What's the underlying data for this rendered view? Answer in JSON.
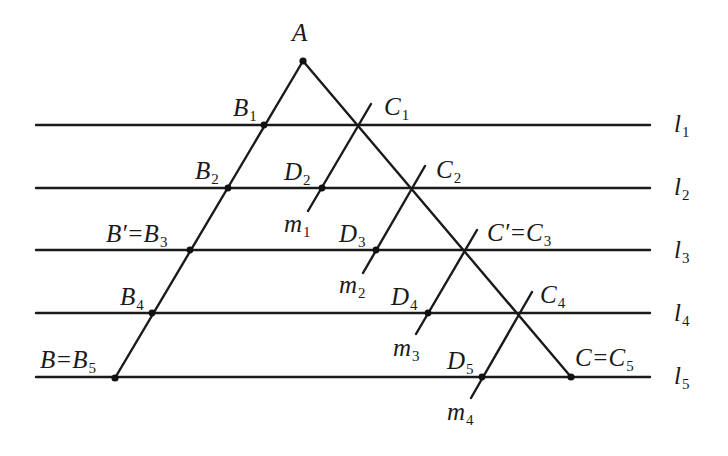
{
  "figure": {
    "points": {
      "A": {
        "label": "A",
        "sub": ""
      },
      "B1": {
        "label": "B",
        "sub": "1"
      },
      "B2": {
        "label": "B",
        "sub": "2"
      },
      "B3": {
        "label": "B′=B",
        "sub": "3"
      },
      "B4": {
        "label": "B",
        "sub": "4"
      },
      "B5": {
        "label": "B=B",
        "sub": "5"
      },
      "C1": {
        "label": "C",
        "sub": "1"
      },
      "C2": {
        "label": "C",
        "sub": "2"
      },
      "C3": {
        "label": "C′=C",
        "sub": "3"
      },
      "C4": {
        "label": "C",
        "sub": "4"
      },
      "C5": {
        "label": "C=C",
        "sub": "5"
      },
      "D2": {
        "label": "D",
        "sub": "2"
      },
      "D3": {
        "label": "D",
        "sub": "3"
      },
      "D4": {
        "label": "D",
        "sub": "4"
      },
      "D5": {
        "label": "D",
        "sub": "5"
      }
    },
    "lines": {
      "l1": {
        "label": "l",
        "sub": "1"
      },
      "l2": {
        "label": "l",
        "sub": "2"
      },
      "l3": {
        "label": "l",
        "sub": "3"
      },
      "l4": {
        "label": "l",
        "sub": "4"
      },
      "l5": {
        "label": "l",
        "sub": "5"
      },
      "m1": {
        "label": "m",
        "sub": "1"
      },
      "m2": {
        "label": "m",
        "sub": "2"
      },
      "m3": {
        "label": "m",
        "sub": "3"
      },
      "m4": {
        "label": "m",
        "sub": "4"
      }
    },
    "colors": {
      "stroke": "#1a1a1a",
      "background": "#ffffff"
    }
  }
}
